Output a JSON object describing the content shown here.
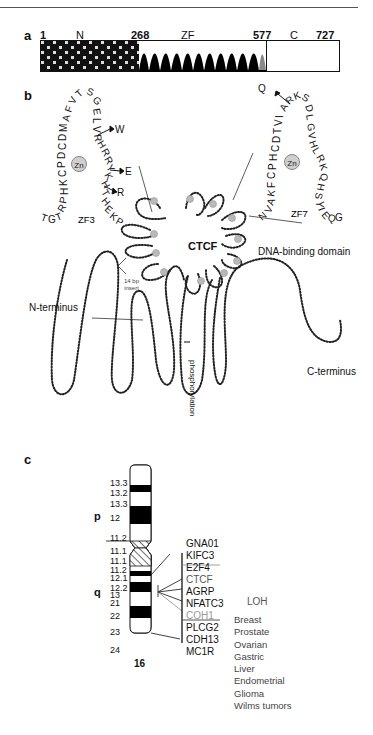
{
  "panel_a": {
    "label": "a",
    "positions": {
      "start": "1",
      "zf_start": "268",
      "zf_end": "577",
      "end": "727"
    },
    "domains": {
      "n": "N",
      "zf": "ZF",
      "c": "C"
    },
    "zinc_finger_count": 11
  },
  "panel_b": {
    "label": "b",
    "center_label": "CTCF",
    "dna_binding_label": "DNA-binding domain",
    "n_terminus_label": "N-terminus",
    "c_terminus_label": "C-terminus",
    "insert_label_line1": "14 bp",
    "insert_label_line2": "insert",
    "phosphorylation_label": "phosphorylation",
    "zf3": {
      "label": "ZF3",
      "zn_label": "Zn",
      "left_arm": "TGTRPHKCPDCDMAFVT",
      "right_arm": "SGELVRHRRYKHTHEKP",
      "mutations": [
        "W",
        "E",
        "R"
      ]
    },
    "zf7": {
      "label": "ZF7",
      "zn_label": "Zn",
      "left_arm": "NVAKFCPHCDTVIARK",
      "right_arm": "SDLGVHLRKQHSYIEQG",
      "mutations": [
        "Q"
      ]
    }
  },
  "panel_c": {
    "label": "c",
    "chromosome_number": "16",
    "arm_p": "p",
    "arm_q": "q",
    "bands": [
      "13.3",
      "13.2",
      "13.3",
      "12",
      "11.2",
      "11.1",
      "11.1",
      "11.2",
      "12.1",
      "12.2",
      "13",
      "21",
      "22",
      "23",
      "24"
    ],
    "genes": [
      "GNA01",
      "KIFC3",
      "E2F4",
      "CTCF",
      "AGRP",
      "NFATC3",
      "COH1",
      "PLCG2",
      "CDH13",
      "MC1R"
    ],
    "loh_label": "LOH",
    "cancers": [
      "Breast",
      "Prostate",
      "Ovarian",
      "Gastric",
      "Liver",
      "Endometrial",
      "Glioma",
      "Wilms tumors"
    ]
  }
}
